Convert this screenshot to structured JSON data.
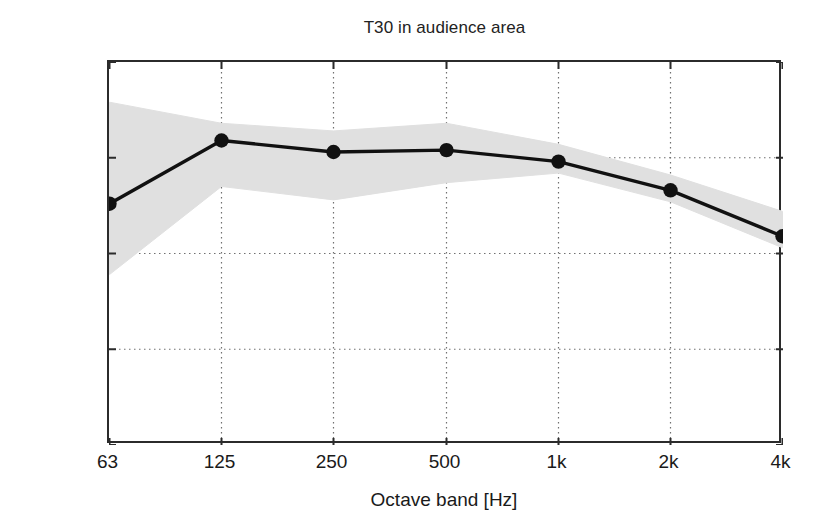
{
  "chart_data": {
    "type": "line",
    "title": "T30 in audience area",
    "xlabel": "Octave band [Hz]",
    "ylabel": "T30 [s]",
    "categories": [
      "63",
      "125",
      "250",
      "500",
      "1k",
      "2k",
      "4k"
    ],
    "xtick_labels": [
      "63",
      "125",
      "250",
      "500",
      "1k",
      "2k",
      "4k"
    ],
    "ytick_labels": [
      "0",
      "0.5",
      "1",
      "1.5",
      "2"
    ],
    "ytick_values": [
      0,
      0.5,
      1,
      1.5,
      2
    ],
    "ylim": [
      0,
      2
    ],
    "grid": "dotted-both",
    "legend": "none",
    "series": [
      {
        "name": "T30 mean",
        "marker": "filled-circle",
        "color": "#111111",
        "values": [
          1.26,
          1.59,
          1.53,
          1.54,
          1.48,
          1.33,
          1.09
        ]
      }
    ],
    "band": {
      "name": "spatial spread (min-max)",
      "color": "#e0e0e0",
      "upper": [
        1.79,
        1.68,
        1.64,
        1.68,
        1.57,
        1.41,
        1.22
      ],
      "lower": [
        0.89,
        1.35,
        1.28,
        1.37,
        1.42,
        1.27,
        1.03
      ]
    }
  }
}
